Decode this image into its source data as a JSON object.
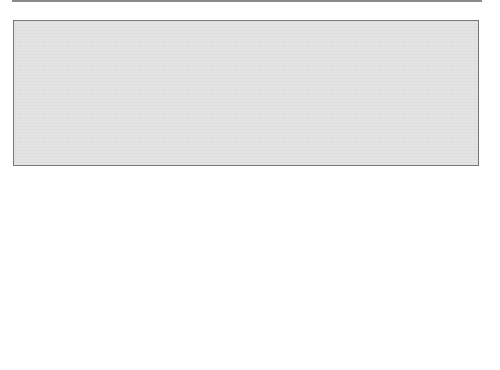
{
  "diagram": {
    "law1": {
      "label": "Law 1",
      "empty_focus": "empty focus",
      "sun": "Sun"
    },
    "law2": {
      "label": "Law 2",
      "radius_vector": "radius vector",
      "sun": "Sun"
    },
    "law3": {
      "label": "Law 3",
      "sun": "Sun",
      "planets": [
        "Mars",
        "Earth",
        "Jupiter",
        "Saturn"
      ]
    },
    "formula": {
      "lhs_num": "P",
      "lhs_num_exp": "2",
      "lhs_den": "a",
      "lhs_den_exp": "3",
      "eq": "=",
      "approx": "≈",
      "terms": [
        {
          "name": "Earth",
          "num": "(1)",
          "den": "(1)"
        },
        {
          "name": "Mars",
          "num": "(1.88081)",
          "den": "(1.52369)"
        },
        {
          "name": "Jupiter",
          "num": "(11.86179)",
          "den": "(5.2028)"
        },
        {
          "name": "Saturn",
          "num": "(29.4566)",
          "den": "(9.53884)"
        }
      ],
      "num_exp": "2",
      "den_exp": "3"
    },
    "colors": {
      "background_grid": "#e6e6e6",
      "orbit_fill": "#a9a9a9",
      "orbit_stroke": "#1a1a1a",
      "sun": "#ffffff",
      "jupiter": "#c0563a",
      "saturn": "#8a7060",
      "planet": "#c8c8c8"
    }
  }
}
